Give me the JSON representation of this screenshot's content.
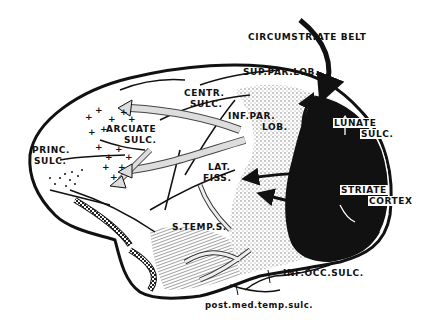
{
  "figure": {
    "type": "anatomical-diagram",
    "labels": {
      "circumstriate_belt": "CIRCUMSTRIATE BELT",
      "sup_par_lob": "SUP.PAR.LOB.",
      "centr_sulc_1": "CENTR.",
      "centr_sulc_2": "SULC.",
      "inf_par_lob_1": "INF.PAR.",
      "inf_par_lob_2": "LOB.",
      "lunate_sulc_1": "LUNATE",
      "lunate_sulc_2": "SULC.",
      "arcuate_sulc_1": "ARCUATE",
      "arcuate_sulc_2": "SULC.",
      "princ_sulc_1": "PRINC.",
      "princ_sulc_2": "SULC.",
      "lat_fiss_1": "LAT.",
      "lat_fiss_2": "FISS.",
      "striate_cortex_1": "STRIATE",
      "striate_cortex_2": "CORTEX",
      "s_temp_s": "S.TEMP.S.",
      "inf_occ_sulc": "INF.OCC.SULC.",
      "post_med_temp_sulc": "post.med.temp.sulc."
    },
    "colors": {
      "ink": "#111111",
      "background": "#ffffff",
      "stipple": "#bdbdbd"
    }
  }
}
